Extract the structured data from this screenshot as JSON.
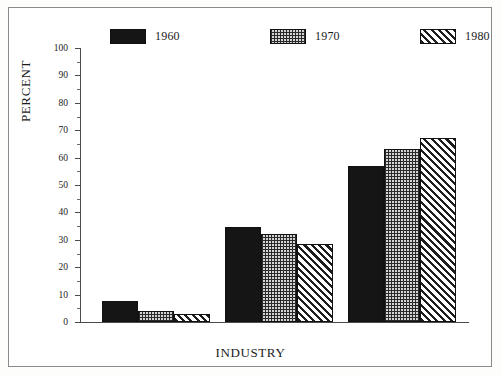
{
  "chart_data": {
    "type": "bar",
    "title": "",
    "xlabel": "INDUSTRY",
    "ylabel": "PERCENT",
    "categories": [
      "Extractive",
      "Transformative",
      "Services"
    ],
    "series": [
      {
        "name": "1960",
        "pattern": "solid",
        "values": [
          7.5,
          34.5,
          57
        ]
      },
      {
        "name": "1970",
        "pattern": "stipple",
        "values": [
          4.0,
          32.0,
          63
        ]
      },
      {
        "name": "1980",
        "pattern": "hatch",
        "values": [
          3.0,
          28.5,
          67
        ]
      }
    ],
    "ylim": [
      0,
      100
    ],
    "ytick_step": 10,
    "yticks": [
      "0",
      "10",
      "20",
      "30",
      "40",
      "50",
      "60",
      "70",
      "80",
      "90",
      "100"
    ],
    "minor_ticks": true,
    "grid": false,
    "legend_position": "top",
    "colors": {
      "series_1960": "#151515",
      "series_1970": "#d4d4d4",
      "series_1980": "#ffffff",
      "axis": "#4b4b4b",
      "text": "#1a1a1a",
      "frame": "#8a8a88",
      "background": "#ffffff"
    }
  }
}
